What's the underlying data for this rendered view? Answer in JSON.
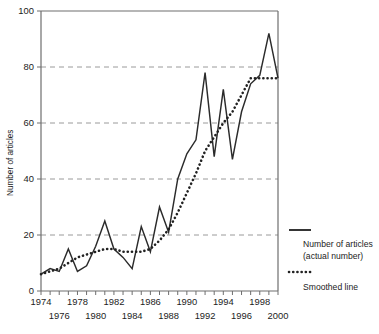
{
  "figure": {
    "width": 379,
    "height": 334,
    "background": "#ffffff"
  },
  "chart_data": {
    "type": "line",
    "title": "",
    "xlabel": "",
    "ylabel": "Number of articles",
    "xlim": [
      1974,
      2000
    ],
    "ylim": [
      0,
      100
    ],
    "yticks": [
      0,
      20,
      40,
      60,
      80,
      100
    ],
    "xticks": [
      1974,
      1975,
      1976,
      1977,
      1978,
      1979,
      1980,
      1981,
      1982,
      1983,
      1984,
      1985,
      1986,
      1987,
      1988,
      1989,
      1990,
      1991,
      1992,
      1993,
      1994,
      1995,
      1996,
      1997,
      1998,
      1999,
      2000
    ],
    "xtick_labels_upper": [
      "1974",
      "1978",
      "1982",
      "1986",
      "1990",
      "1994",
      "1998"
    ],
    "xtick_labels_lower": [
      "1976",
      "1980",
      "1984",
      "1988",
      "1992",
      "1996",
      "2000"
    ],
    "grid": "horizontal-dashed",
    "legend_position": "right",
    "x": [
      1974,
      1975,
      1976,
      1977,
      1978,
      1979,
      1980,
      1981,
      1982,
      1983,
      1984,
      1985,
      1986,
      1987,
      1988,
      1989,
      1990,
      1991,
      1992,
      1993,
      1994,
      1995,
      1996,
      1997,
      1998,
      1999,
      2000
    ],
    "series": [
      {
        "name": "Number of articles (actual number)",
        "style": "solid",
        "color": "#2b2b2b",
        "values": [
          6,
          8,
          7,
          15,
          7,
          9,
          16,
          25,
          15,
          12,
          8,
          23,
          14,
          30,
          21,
          40,
          49,
          54,
          78,
          48,
          72,
          47,
          64,
          74,
          77,
          92,
          76
        ]
      },
      {
        "name": "Smoothed line",
        "style": "dotted",
        "color": "#222222",
        "values": [
          6,
          7,
          8,
          10,
          12,
          13,
          14,
          15,
          15,
          14,
          14,
          14,
          15,
          18,
          22,
          28,
          35,
          42,
          50,
          55,
          60,
          64,
          70,
          76,
          76,
          76,
          76
        ]
      }
    ]
  },
  "legend": {
    "entries": [
      {
        "swatch": "solid-line",
        "label_line1": "Number of articles",
        "label_line2": "(actual number)"
      },
      {
        "swatch": "dotted-line",
        "label_line1": "Smoothed line",
        "label_line2": ""
      }
    ]
  }
}
